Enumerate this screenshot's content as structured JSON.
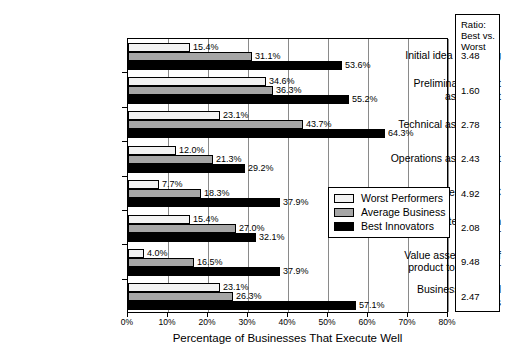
{
  "chart_data": {
    "type": "bar",
    "orientation": "horizontal",
    "title": "",
    "xlabel": "Percentage of Businesses That Execute Well",
    "ylabel": "",
    "xlim": [
      0,
      80
    ],
    "xticks": [
      "0%",
      "10%",
      "20%",
      "30%",
      "40%",
      "50%",
      "60%",
      "70%",
      "80%"
    ],
    "xtick_values": [
      0,
      10,
      20,
      30,
      40,
      50,
      60,
      70,
      80
    ],
    "grid": "vertical",
    "legend_position": "inside-right",
    "categories": [
      "Initial idea screening",
      "Preliminary market assessment",
      "Technical assessment",
      "Operations assessment",
      "Market research, VoC",
      "Concept testing with customer",
      "Value assessment of product to customer",
      "Business/financial analysis"
    ],
    "series": [
      {
        "name": "Worst Performers",
        "color": "#f2f2f2",
        "values": [
          15.4,
          34.6,
          23.1,
          12.0,
          7.7,
          15.4,
          4.0,
          23.1
        ],
        "labels": [
          "15.4%",
          "34.6%",
          "23.1%",
          "12.0%",
          "7.7%",
          "15.4%",
          "4.0%",
          "23.1%"
        ]
      },
      {
        "name": "Average Business",
        "color": "#a6a6a6",
        "values": [
          31.1,
          36.3,
          43.7,
          21.3,
          18.3,
          27.0,
          16.5,
          26.3
        ],
        "labels": [
          "31.1%",
          "36.3%",
          "43.7%",
          "21.3%",
          "18.3%",
          "27.0%",
          "16.5%",
          "26.3%"
        ]
      },
      {
        "name": "Best Innovators",
        "color": "#000000",
        "values": [
          53.6,
          55.2,
          64.3,
          29.2,
          37.9,
          32.1,
          37.9,
          57.1
        ],
        "labels": [
          "53.6%",
          "55.2%",
          "64.3%",
          "29.2%",
          "37.9%",
          "32.1%",
          "37.9%",
          "57.1%"
        ]
      }
    ],
    "ratio_column": {
      "header_lines": [
        "Ratio:",
        "Best vs.",
        "Worst"
      ],
      "values": [
        "3.48",
        "1.60",
        "2.78",
        "2.43",
        "4.92",
        "2.08",
        "9.48",
        "2.47"
      ]
    }
  },
  "category_lines": [
    [
      "Initial idea screening"
    ],
    [
      "Preliminary market",
      "assessment"
    ],
    [
      "Technical assessment"
    ],
    [
      "Operations assessment"
    ],
    [
      "Market research, VoC"
    ],
    [
      "Concept testing with",
      "customer"
    ],
    [
      "Value assessment of",
      "product to customer"
    ],
    [
      "Business/financial",
      "analysis"
    ]
  ]
}
